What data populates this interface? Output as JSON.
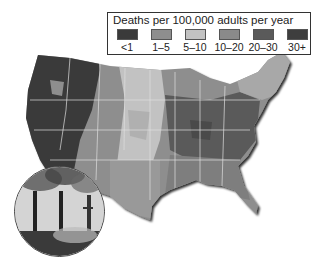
{
  "legend": {
    "title": "Deaths per 100,000 adults per year",
    "items": [
      {
        "label": "<1",
        "color": "#3a3a3a"
      },
      {
        "label": "1–5",
        "color": "#8e8e8e"
      },
      {
        "label": "5–10",
        "color": "#c2c2c2"
      },
      {
        "label": "10–20",
        "color": "#8a8a8a"
      },
      {
        "label": "20–30",
        "color": "#5a5a5a"
      },
      {
        "label": "30+",
        "color": "#3e3e3e"
      }
    ]
  },
  "map": {
    "region": "Contiguous United States",
    "subject": "Deaths attributable to fine particulate air pollution by county",
    "colors": {
      "west_low": "#3a3a3a",
      "mountain": "#8e8e8e",
      "plains": "#c2c2c2",
      "midwest_east": "#5a5a5a",
      "southeast": "#8a8a8a",
      "state_borders": "#e0e0e0"
    }
  },
  "inset_photo": {
    "subject": "Smokestacks emitting smoke"
  }
}
